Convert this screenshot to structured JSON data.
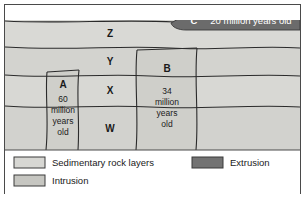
{
  "figure": {
    "colors": {
      "sedimentary": "#d7d7d3",
      "sedimentary_alt": "#d2d2ce",
      "intrusion": "#cfcfca",
      "extrusion": "#6b6b6b",
      "line": "#2b2b2b",
      "frame": "#4a4a4a",
      "background": "#ffffff",
      "text": "#1a1a1a",
      "text_light": "#ffffff"
    }
  },
  "strata": {
    "layers": [
      {
        "id": "Z",
        "label": "Z"
      },
      {
        "id": "Y",
        "label": "Y"
      },
      {
        "id": "X",
        "label": "X"
      },
      {
        "id": "W",
        "label": "W"
      }
    ]
  },
  "intrusions": [
    {
      "id": "A",
      "label": "A",
      "age_lines": [
        "60",
        "million",
        "years",
        "old"
      ],
      "age_text": "60 million years old"
    },
    {
      "id": "B",
      "label": "B",
      "age_lines": [
        "34",
        "million",
        "years",
        "old"
      ],
      "age_text": "34 million years old"
    }
  ],
  "extrusion": {
    "id": "C",
    "label": "C",
    "age_text": "20 million years old"
  },
  "legend": {
    "items": [
      {
        "id": "sedimentary",
        "label": "Sedimentary rock layers",
        "swatch": "#d7d7d3"
      },
      {
        "id": "intrusion",
        "label": "Intrusion",
        "swatch": "#c6c6c1"
      },
      {
        "id": "extrusion",
        "label": "Extrusion",
        "swatch": "#737373"
      }
    ]
  }
}
